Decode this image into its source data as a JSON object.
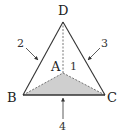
{
  "diagram": {
    "vertices": {
      "D": {
        "label": "D",
        "x": 63,
        "y": 22
      },
      "A": {
        "label": "A",
        "x": 63,
        "y": 73
      },
      "B": {
        "label": "B",
        "x": 23,
        "y": 95
      },
      "C": {
        "label": "C",
        "x": 105,
        "y": 95
      }
    },
    "edge_labels": {
      "face1": "1",
      "edge2": "2",
      "edge3": "3",
      "edge4": "4"
    },
    "colors": {
      "stroke": "#333333",
      "base_fill": "#cfcfcf",
      "hidden_edge": "#555555"
    }
  }
}
